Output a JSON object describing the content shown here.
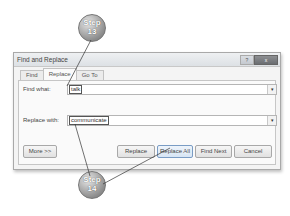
{
  "dialog": {
    "title": "Find and Replace",
    "controls": {
      "help": "?",
      "close": "x"
    },
    "tabs": [
      {
        "label": "Find",
        "active": false
      },
      {
        "label": "Replace",
        "active": true
      },
      {
        "label": "Go To",
        "active": false
      }
    ],
    "find": {
      "label": "Find what:",
      "value": "talk",
      "dropdown_icon": "▾"
    },
    "replace": {
      "label": "Replace with:",
      "value": "communicate",
      "dropdown_icon": "▾"
    },
    "buttons": {
      "more": "More >>",
      "replace": "Replace",
      "replace_all": "Replace All",
      "find_next": "Find Next",
      "cancel": "Cancel"
    }
  },
  "callouts": [
    {
      "line1": "Step",
      "line2": "13"
    },
    {
      "line1": "Step",
      "line2": "14"
    }
  ],
  "colors": {
    "callout": "#8e8e8e",
    "dialog_bg": "#f4f4f4",
    "accent": "#7a9cc4"
  }
}
